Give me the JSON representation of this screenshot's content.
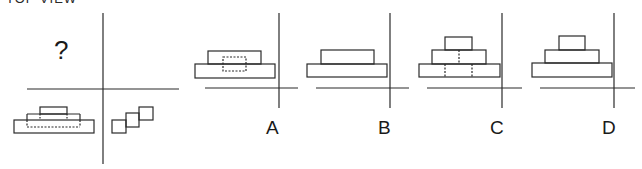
{
  "header": {
    "title": "TOP VIEW"
  },
  "question": {
    "placeholder": "?"
  },
  "options": [
    {
      "label": "A"
    },
    {
      "label": "B"
    },
    {
      "label": "C"
    },
    {
      "label": "D"
    }
  ],
  "colors": {
    "stroke": "#2a2a2a",
    "background": "#ffffff"
  }
}
